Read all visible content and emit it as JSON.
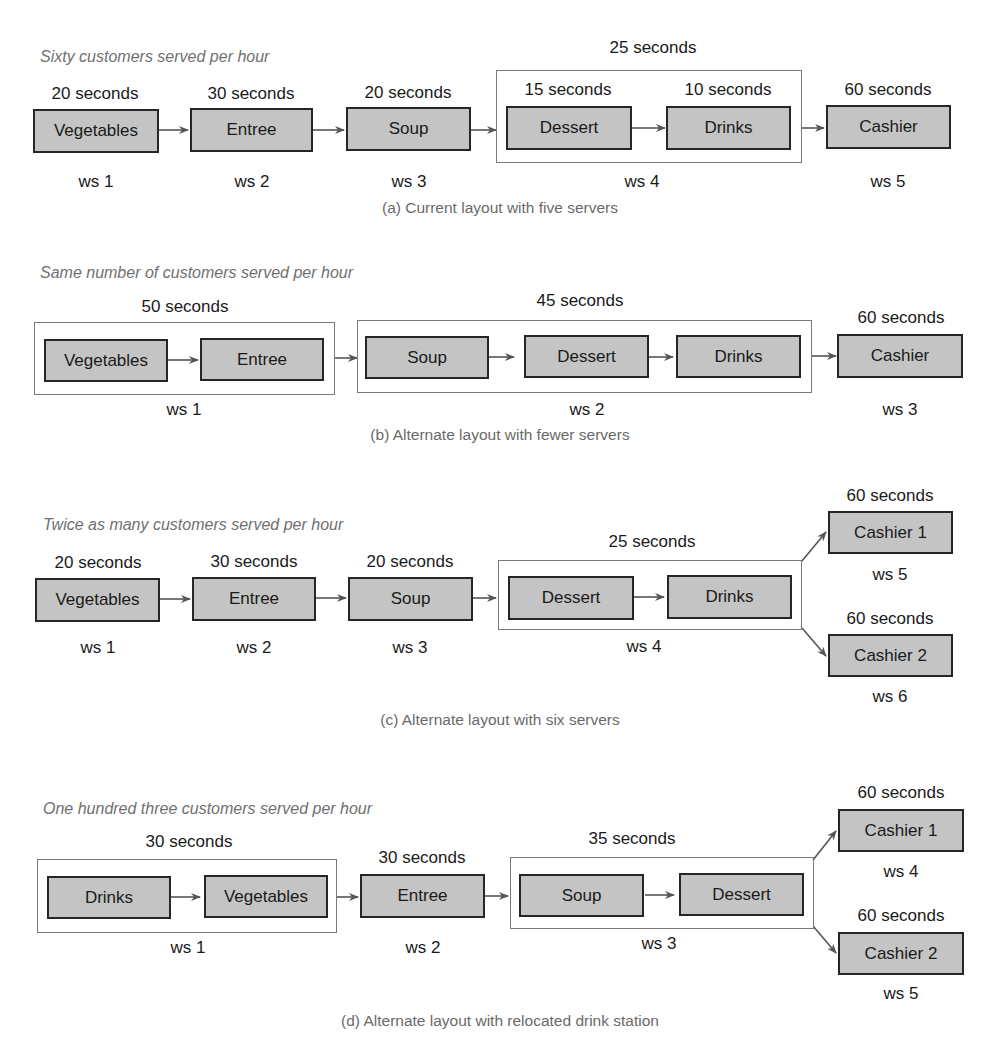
{
  "diagrams": {
    "a": {
      "subtitle": "Sixty customers served per hour",
      "caption": "(a) Current layout with five servers",
      "stations": [
        {
          "label": "Vegetables",
          "time": "20 seconds"
        },
        {
          "label": "Entree",
          "time": "30 seconds"
        },
        {
          "label": "Soup",
          "time": "20 seconds"
        },
        {
          "label": "Dessert",
          "time": "15 seconds"
        },
        {
          "label": "Drinks",
          "time": "10 seconds"
        },
        {
          "label": "Cashier",
          "time": "60 seconds"
        }
      ],
      "groups": [
        {
          "time": "25 seconds"
        }
      ],
      "workstations": [
        "ws 1",
        "ws 2",
        "ws 3",
        "ws 4",
        "ws 5"
      ]
    },
    "b": {
      "subtitle": "Same number of customers served per hour",
      "caption": "(b) Alternate layout with fewer servers",
      "stations": [
        {
          "label": "Vegetables"
        },
        {
          "label": "Entree"
        },
        {
          "label": "Soup"
        },
        {
          "label": "Dessert"
        },
        {
          "label": "Drinks"
        },
        {
          "label": "Cashier",
          "time": "60 seconds"
        }
      ],
      "groups": [
        {
          "time": "50 seconds"
        },
        {
          "time": "45 seconds"
        }
      ],
      "workstations": [
        "ws 1",
        "ws 2",
        "ws 3"
      ]
    },
    "c": {
      "subtitle": "Twice as many customers served per hour",
      "caption": "(c) Alternate layout with six servers",
      "stations": [
        {
          "label": "Vegetables",
          "time": "20 seconds"
        },
        {
          "label": "Entree",
          "time": "30 seconds"
        },
        {
          "label": "Soup",
          "time": "20 seconds"
        },
        {
          "label": "Dessert"
        },
        {
          "label": "Drinks"
        },
        {
          "label": "Cashier 1",
          "time": "60 seconds"
        },
        {
          "label": "Cashier 2",
          "time": "60 seconds"
        }
      ],
      "groups": [
        {
          "time": "25 seconds"
        }
      ],
      "workstations": [
        "ws 1",
        "ws 2",
        "ws 3",
        "ws 4",
        "ws 5",
        "ws 6"
      ]
    },
    "d": {
      "subtitle": "One hundred three customers served per hour",
      "caption": "(d) Alternate layout with relocated drink station",
      "stations": [
        {
          "label": "Drinks"
        },
        {
          "label": "Vegetables"
        },
        {
          "label": "Entree",
          "time": "30 seconds"
        },
        {
          "label": "Soup"
        },
        {
          "label": "Dessert"
        },
        {
          "label": "Cashier 1",
          "time": "60 seconds"
        },
        {
          "label": "Cashier 2",
          "time": "60 seconds"
        }
      ],
      "groups": [
        {
          "time": "30 seconds"
        },
        {
          "time": "35 seconds"
        }
      ],
      "workstations": [
        "ws 1",
        "ws 2",
        "ws 3",
        "ws 4",
        "ws 5"
      ]
    }
  },
  "colors": {
    "station_fill": "#c4c4c4",
    "station_border": "#262626",
    "group_border": "#7a7a7a",
    "arrow": "#555555",
    "subtitle_text": "#707070",
    "caption_text": "#6a6a6a"
  }
}
